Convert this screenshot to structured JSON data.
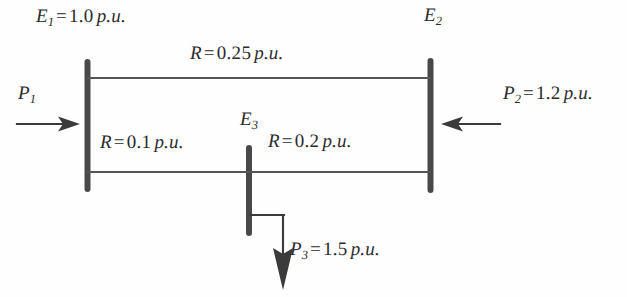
{
  "diagram": {
    "background_color": "#fefefe",
    "ink_color": "#2b2b2b",
    "buses": [
      {
        "id": "bus1",
        "label_var": "E",
        "label_sub": "1",
        "value": "1.0",
        "unit": "p.u.",
        "equals": "="
      },
      {
        "id": "bus2",
        "label_var": "E",
        "label_sub": "2",
        "value": "",
        "unit": "",
        "equals": ""
      },
      {
        "id": "bus3",
        "label_var": "E",
        "label_sub": "3",
        "value": "",
        "unit": "",
        "equals": ""
      }
    ],
    "labels": {
      "e1": {
        "var": "E",
        "sub": "1",
        "eq": "=",
        "num": "1.0",
        "unit": "p.u."
      },
      "e2": {
        "var": "E",
        "sub": "2"
      },
      "e3": {
        "var": "E",
        "sub": "3"
      },
      "r_top": {
        "var": "R",
        "eq": "=",
        "num": "0.25",
        "unit": "p.u."
      },
      "r_left": {
        "var": "R",
        "eq": "=",
        "num": "0.1",
        "unit": "p.u."
      },
      "r_right": {
        "var": "R",
        "eq": "=",
        "num": "0.2",
        "unit": "p.u."
      },
      "p1": {
        "var": "P",
        "sub": "1"
      },
      "p2": {
        "var": "P",
        "sub": "2",
        "eq": "=",
        "num": "1.2",
        "unit": "p.u."
      },
      "p3": {
        "var": "P",
        "sub": "3",
        "eq": "=",
        "num": "1.5",
        "unit": "p.u."
      }
    },
    "branches": [
      {
        "id": "top",
        "from": "bus1",
        "to": "bus2",
        "resistance": "0.25",
        "unit": "p.u."
      },
      {
        "id": "lower-left",
        "from": "bus1",
        "to": "bus3",
        "resistance": "0.1",
        "unit": "p.u."
      },
      {
        "id": "lower-right",
        "from": "bus3",
        "to": "bus2",
        "resistance": "0.2",
        "unit": "p.u."
      }
    ],
    "injections": [
      {
        "id": "p1",
        "bus": "bus1",
        "symbol": "P1",
        "value": "",
        "unit": "",
        "direction": "into-bus-from-left"
      },
      {
        "id": "p2",
        "bus": "bus2",
        "symbol": "P2",
        "value": "1.2",
        "unit": "p.u.",
        "direction": "into-bus-from-right"
      },
      {
        "id": "p3",
        "bus": "bus3",
        "symbol": "P3",
        "value": "1.5",
        "unit": "p.u.",
        "direction": "out-of-bus-downward"
      }
    ]
  }
}
